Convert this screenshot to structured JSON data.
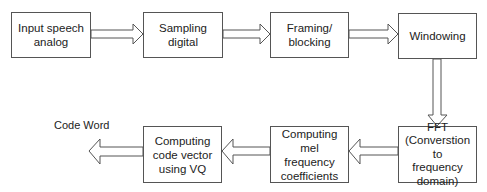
{
  "diagram": {
    "type": "flowchart",
    "title": "",
    "boxes": [
      {
        "id": "input",
        "label": "Input speech\nanalog"
      },
      {
        "id": "sampling",
        "label": "Sampling\ndigital"
      },
      {
        "id": "framing",
        "label": "Framing/\nblocking"
      },
      {
        "id": "windowing",
        "label": "Windowing"
      },
      {
        "id": "fft",
        "label": "FFT\n(Converstion to\nfrequency\ndomain)"
      },
      {
        "id": "mel",
        "label": "Computing mel\nfrequency\ncoefficients"
      },
      {
        "id": "vq",
        "label": "Computing\ncode vector\nusing VQ"
      }
    ],
    "output_label": "Code Word",
    "edges": [
      {
        "from": "input",
        "to": "sampling"
      },
      {
        "from": "sampling",
        "to": "framing"
      },
      {
        "from": "framing",
        "to": "windowing"
      },
      {
        "from": "windowing",
        "to": "fft"
      },
      {
        "from": "fft",
        "to": "mel"
      },
      {
        "from": "mel",
        "to": "vq"
      },
      {
        "from": "vq",
        "to": "output"
      }
    ],
    "colors": {
      "stroke": "#555555",
      "text": "#222222",
      "background": "#ffffff"
    }
  }
}
